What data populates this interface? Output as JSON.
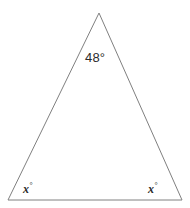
{
  "figure": {
    "kind": "isosceles-triangle-angle-diagram",
    "background_color": "#ffffff",
    "stroke_color": "#808080",
    "stroke_width": 1,
    "text_color": "#2b2b2b",
    "canvas": {
      "width": 190,
      "height": 208
    },
    "vertices": {
      "apex": {
        "x": 99,
        "y": 13
      },
      "bottom_left": {
        "x": 8,
        "y": 200
      },
      "bottom_right": {
        "x": 182,
        "y": 200
      }
    },
    "labels": {
      "apex_angle": "48°",
      "left_base_angle_variable": "x",
      "left_base_angle_degree": "°",
      "right_base_angle_variable": "x",
      "right_base_angle_degree": "°"
    }
  },
  "chart_data": {
    "type": "diagram",
    "title": "",
    "shape": "triangle",
    "points": [
      {
        "name": "apex",
        "x": 99,
        "y": 13,
        "angle_label": "48°",
        "angle_value": 48
      },
      {
        "name": "bottom-left",
        "x": 8,
        "y": 200,
        "angle_label": "x°",
        "angle_value": null
      },
      {
        "name": "bottom-right",
        "x": 182,
        "y": 200,
        "angle_label": "x°",
        "angle_value": null
      }
    ],
    "edges": [
      {
        "from": "apex",
        "to": "bottom-left"
      },
      {
        "from": "bottom-left",
        "to": "bottom-right"
      },
      {
        "from": "bottom-right",
        "to": "apex"
      }
    ],
    "annotations": [
      "48°",
      "x°",
      "x°"
    ],
    "grid": false,
    "legend": null
  }
}
